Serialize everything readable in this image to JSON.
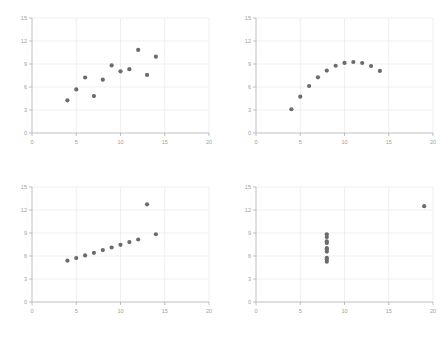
{
  "figure": {
    "background_color": "#ffffff",
    "layout": "2x2 grid of scatter plots",
    "panel_count": 4
  },
  "style": {
    "marker_color": "#6b6b6b",
    "marker_radius": 2.1,
    "grid_color": "#e8e8e8",
    "axis_color": "#b8b8b8",
    "tick_label_color": "#a0a0a0"
  },
  "axes": {
    "xlim": [
      0,
      20
    ],
    "ylim": [
      0,
      15
    ],
    "xticks": [
      0,
      5,
      10,
      15,
      20
    ],
    "yticks": [
      0,
      3,
      6,
      9,
      12,
      15
    ],
    "xtick_labels": [
      "0",
      "5",
      "10",
      "15",
      "20"
    ],
    "ytick_labels": [
      "0",
      "3",
      "6",
      "9",
      "12",
      "15"
    ],
    "grid": true,
    "xlabel": "",
    "ylabel": ""
  },
  "chart_data": [
    {
      "type": "scatter",
      "title": "",
      "xlabel": "",
      "ylabel": "",
      "xlim": [
        0,
        20
      ],
      "ylim": [
        0,
        15
      ],
      "xticks": [
        0,
        5,
        10,
        15,
        20
      ],
      "yticks": [
        0,
        3,
        6,
        9,
        12,
        15
      ],
      "grid": true,
      "legend": null,
      "x": [
        10,
        8,
        13,
        9,
        11,
        14,
        6,
        4,
        12,
        7,
        5
      ],
      "y": [
        8.04,
        6.95,
        7.58,
        8.81,
        8.33,
        9.96,
        7.24,
        4.26,
        10.84,
        4.82,
        5.68
      ]
    },
    {
      "type": "scatter",
      "title": "",
      "xlabel": "",
      "ylabel": "",
      "xlim": [
        0,
        20
      ],
      "ylim": [
        0,
        15
      ],
      "xticks": [
        0,
        5,
        10,
        15,
        20
      ],
      "yticks": [
        0,
        3,
        6,
        9,
        12,
        15
      ],
      "grid": true,
      "legend": null,
      "x": [
        10,
        8,
        13,
        9,
        11,
        14,
        6,
        4,
        12,
        7,
        5
      ],
      "y": [
        9.14,
        8.14,
        8.74,
        8.77,
        9.26,
        8.1,
        6.13,
        3.1,
        9.13,
        7.26,
        4.74
      ]
    },
    {
      "type": "scatter",
      "title": "",
      "xlabel": "",
      "ylabel": "",
      "xlim": [
        0,
        20
      ],
      "ylim": [
        0,
        15
      ],
      "xticks": [
        0,
        5,
        10,
        15,
        20
      ],
      "yticks": [
        0,
        3,
        6,
        9,
        12,
        15
      ],
      "grid": true,
      "legend": null,
      "x": [
        10,
        8,
        13,
        9,
        11,
        14,
        6,
        4,
        12,
        7,
        5
      ],
      "y": [
        7.46,
        6.77,
        12.74,
        7.11,
        7.81,
        8.84,
        6.08,
        5.39,
        8.15,
        6.42,
        5.73
      ]
    },
    {
      "type": "scatter",
      "title": "",
      "xlabel": "",
      "ylabel": "",
      "xlim": [
        0,
        20
      ],
      "ylim": [
        0,
        15
      ],
      "xticks": [
        0,
        5,
        10,
        15,
        20
      ],
      "yticks": [
        0,
        3,
        6,
        9,
        12,
        15
      ],
      "grid": true,
      "legend": null,
      "x": [
        8,
        8,
        8,
        8,
        8,
        8,
        8,
        19,
        8,
        8,
        8
      ],
      "y": [
        6.58,
        5.76,
        7.71,
        8.84,
        8.47,
        7.04,
        5.25,
        12.5,
        5.56,
        7.91,
        6.89
      ]
    }
  ]
}
